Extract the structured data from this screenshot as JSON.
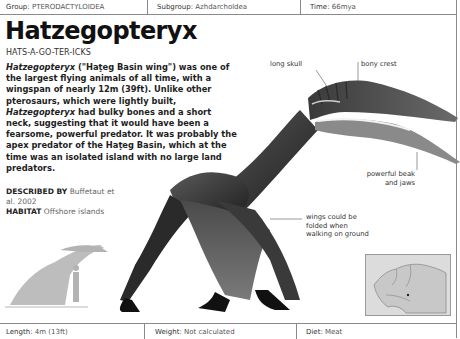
{
  "header": {
    "group_label": "Group:",
    "group_value": "PTERODACTYLOIDEA",
    "subgroup_label": "Subgroup:",
    "subgroup_value": "Azhdarcholdea",
    "time_label": "Time:",
    "time_value": "66mya"
  },
  "entry": {
    "title": "Hatzegopteryx",
    "pronunciation": "HATS-A-GO-TER-ICKS",
    "description": {
      "italic_name": "Hatzegopteryx",
      "part1": " (\"Haţeg Basin wing\") was one of the largest flying animals of all time, with a wingspan of nearly 12m (39ft). Unlike other pterosaurs, which were lightly built, ",
      "italic_name_2": "Hatzegopteryx",
      "part2": " had bulky bones and a short neck, suggesting that it would have been a fearsome, powerful predator. It was probably the apex predator of the Haţeg Basin, which at the time was an isolated island with no large land predators."
    },
    "described_by_label": "DESCRIBED BY",
    "described_by_value": "Buffetaut et al. 2002",
    "habitat_label": "HABITAT",
    "habitat_value": "Offshore islands"
  },
  "annotations": {
    "long_skull": "long skull",
    "bony_crest": "bony crest",
    "beak": "powerful beak and jaws",
    "wings": "wings could be folded when walking on ground"
  },
  "footer": {
    "length_label": "Length:",
    "length_value": "4m (13ft)",
    "weight_label": "Weight:",
    "weight_value": "Not calculated",
    "diet_label": "Diet:",
    "diet_value": "Meat"
  },
  "images": {
    "main": "pterosaur-illustration",
    "scale": "scale-silhouette-with-human",
    "map": "europe-locator-map"
  }
}
